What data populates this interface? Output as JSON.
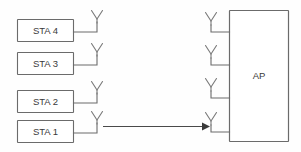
{
  "diagram": {
    "canvas": {
      "width": 301,
      "height": 152,
      "background": "#fefefe"
    },
    "colors": {
      "box_stroke": "#6b6b6b",
      "box_fill": "#ffffff",
      "antenna_stroke": "#7a7a7a",
      "lead_stroke": "#6b6b6b",
      "arrow": "#3a3a3a",
      "text": "#3a3a3a"
    },
    "stations": [
      {
        "label": "STA 4",
        "x": 17,
        "y": 19,
        "w": 56,
        "h": 22,
        "antenna_x": 97,
        "antenna_tip_y": 10
      },
      {
        "label": "STA 3",
        "x": 17,
        "y": 52,
        "w": 56,
        "h": 22,
        "antenna_x": 97,
        "antenna_tip_y": 43
      },
      {
        "label": "STA 2",
        "x": 17,
        "y": 90,
        "w": 56,
        "h": 22,
        "antenna_x": 97,
        "antenna_tip_y": 81
      },
      {
        "label": "STA 1",
        "x": 17,
        "y": 120,
        "w": 56,
        "h": 22,
        "antenna_x": 97,
        "antenna_tip_y": 111
      }
    ],
    "access_point": {
      "label": "AP",
      "x": 229,
      "y": 10,
      "w": 60,
      "h": 132,
      "antennas": [
        {
          "x": 211,
          "tip_y": 12,
          "lead_y": 32
        },
        {
          "x": 211,
          "tip_y": 45,
          "lead_y": 65
        },
        {
          "x": 211,
          "tip_y": 78,
          "lead_y": 98
        },
        {
          "x": 211,
          "tip_y": 112,
          "lead_y": 132
        }
      ]
    },
    "arrow": {
      "from_x": 103,
      "to_x": 208,
      "y": 126,
      "description": "uplink from STA 1 antenna to AP antenna"
    }
  }
}
